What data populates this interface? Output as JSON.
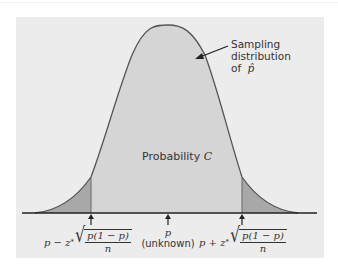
{
  "figure": {
    "curve_label_lines": [
      "Sampling",
      "distribution",
      "of"
    ],
    "curve_label_symbol": "p̂",
    "center_region_label_prefix": "Probability",
    "center_region_label_var": "C",
    "center_marker": {
      "symbol": "p",
      "note": "(unknown)"
    },
    "left_bound": {
      "prefix": "p − z",
      "star": "*",
      "numerator": "p(1 − p)",
      "denominator": "n"
    },
    "right_bound": {
      "prefix": "p + z",
      "star": "*",
      "numerator": "p(1 − p)",
      "denominator": "n"
    },
    "colors": {
      "panel_background": "#ececec",
      "curve_fill": "#d5d5d5",
      "tail_fill": "#a8a8a8",
      "curve_stroke": "#555555",
      "axis": "#222222"
    }
  }
}
